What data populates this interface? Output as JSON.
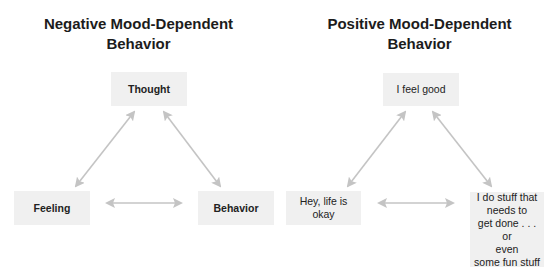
{
  "colors": {
    "background": "#ffffff",
    "node_fill": "#f0f0f0",
    "arrow": "#c4c4c4",
    "text": "#1c1c1c"
  },
  "diagrams": [
    {
      "title": "Negative Mood-Dependent\nBehavior",
      "nodes": {
        "top": "Thought",
        "left": "Feeling",
        "right": "Behavior"
      }
    },
    {
      "title": "Positive Mood-Dependent\nBehavior",
      "nodes": {
        "top": "I feel good",
        "left": "Hey, life is\nokay",
        "right": "I do stuff that\nneeds to\nget done . . . or\neven\nsome fun stuff"
      }
    }
  ],
  "arrows": [
    {
      "from": "top",
      "to": "left",
      "type": "bidirectional"
    },
    {
      "from": "top",
      "to": "right",
      "type": "bidirectional"
    },
    {
      "from": "left",
      "to": "right",
      "type": "bidirectional"
    }
  ]
}
